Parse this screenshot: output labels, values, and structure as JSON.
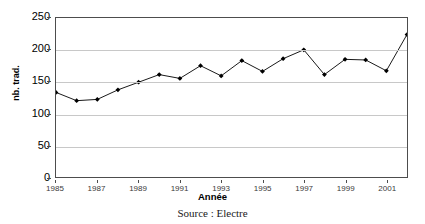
{
  "chart_data": {
    "type": "line",
    "title": "",
    "xlabel": "Année",
    "ylabel": "nb. trad.",
    "ylim": [
      0,
      250
    ],
    "yticks": [
      0,
      50,
      100,
      150,
      200,
      250
    ],
    "xlim": [
      1985,
      2002
    ],
    "xticks": [
      1985,
      1987,
      1989,
      1991,
      1993,
      1995,
      1997,
      1999,
      2001
    ],
    "grid": "horizontal",
    "legend": "none",
    "marker": "diamond",
    "marker_color": "#000000",
    "line_color": "#000000",
    "x": [
      1985,
      1986,
      1987,
      1988,
      1989,
      1990,
      1991,
      1992,
      1993,
      1994,
      1995,
      1996,
      1997,
      1998,
      1999,
      2000,
      2001,
      2002
    ],
    "values": [
      133,
      120,
      122,
      137,
      149,
      161,
      155,
      175,
      159,
      183,
      166,
      186,
      200,
      161,
      185,
      184,
      167,
      224
    ],
    "series": [
      {
        "name": "nb. trad.",
        "values": [
          133,
          120,
          122,
          137,
          149,
          161,
          155,
          175,
          159,
          183,
          166,
          186,
          200,
          161,
          185,
          184,
          167,
          224
        ]
      }
    ]
  },
  "caption": {
    "source": "Source : Electre"
  }
}
